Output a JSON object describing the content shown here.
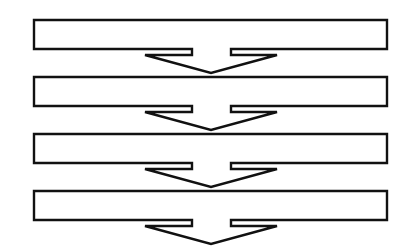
{
  "diagram": {
    "type": "process-flow",
    "orientation": "vertical",
    "colors": {
      "stroke": "#111111",
      "fill": "#ffffff",
      "background": "#ffffff"
    },
    "steps": [
      {
        "label": ""
      },
      {
        "label": ""
      },
      {
        "label": ""
      },
      {
        "label": ""
      }
    ],
    "connector": "down-arrow"
  }
}
